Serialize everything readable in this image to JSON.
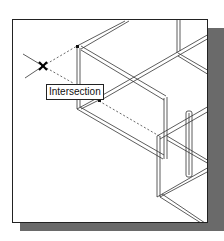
{
  "viewport": {
    "tooltip_label": "Intersection",
    "marker_icon": "x-cross-icon",
    "colors": {
      "line": "#333333",
      "shadow": "#6a6a6a",
      "background": "#ffffff"
    }
  }
}
